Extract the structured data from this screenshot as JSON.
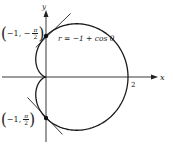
{
  "figure": {
    "origin_px": [
      46,
      77
    ],
    "scale_px_per_unit": 41,
    "curve": {
      "equation": "r = −1 + cos θ",
      "a": -1,
      "b": 1,
      "color": "#1a1a1a"
    },
    "axes": {
      "x_label": "x",
      "y_label": "y",
      "x_tick_label": "2",
      "color": "#222222"
    },
    "points": [
      {
        "name": "top",
        "r": -1,
        "theta_label": "−π/2",
        "label_prefix": "−1, −",
        "num": "π",
        "den": "2"
      },
      {
        "name": "bottom",
        "r": -1,
        "theta_label": "π/2",
        "label_prefix": "−1, ",
        "num": "π",
        "den": "2"
      }
    ],
    "tangents": [
      {
        "name": "top-tangent",
        "from": [
          -0.25,
          0.72
        ],
        "to": [
          0.6,
          1.55
        ]
      },
      {
        "name": "bottom-tangent",
        "from": [
          -0.45,
          -0.5
        ],
        "to": [
          0.4,
          -1.4
        ]
      }
    ]
  }
}
